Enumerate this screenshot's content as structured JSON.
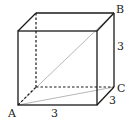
{
  "figure": {
    "type": "cube",
    "labels": {
      "vertex_a": "A",
      "vertex_b": "B",
      "vertex_c": "C",
      "edge_front_bottom": "3",
      "edge_right_vertical": "3",
      "edge_depth": "3"
    },
    "colors": {
      "edge": "#1a1a1a",
      "hidden_edge": "#1a1a1a",
      "diagonal": "#b8b8b8",
      "label": "#222222",
      "background": "#ffffff"
    }
  }
}
